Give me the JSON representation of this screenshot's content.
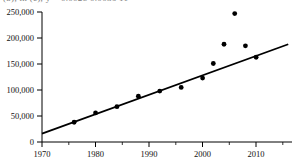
{
  "top_cropped_text": "(b), in (c), y = 0.0028  0.0036  11",
  "chart_data": {
    "type": "scatter",
    "title": "",
    "xlabel": "",
    "ylabel": "",
    "xlim": [
      1970,
      2016
    ],
    "ylim": [
      0,
      250000
    ],
    "grid": false,
    "legend": "none",
    "x_ticks": [
      1970,
      1980,
      1990,
      2000,
      2010
    ],
    "x_tick_labels": [
      "1970",
      "1980",
      "1990",
      "2000",
      "2010"
    ],
    "x_minor_ticks": [
      1975,
      1985,
      1995,
      2005,
      2015
    ],
    "y_ticks": [
      0,
      50000,
      100000,
      150000,
      200000,
      250000
    ],
    "y_tick_labels": [
      "0",
      "50,000",
      "100,000",
      "150,000",
      "200,000",
      "250,000"
    ],
    "marker": "filled-circle",
    "marker_color": "#000000",
    "points": [
      {
        "x": 1976,
        "y": 38000
      },
      {
        "x": 1980,
        "y": 56000
      },
      {
        "x": 1984,
        "y": 68000
      },
      {
        "x": 1988,
        "y": 88000
      },
      {
        "x": 1992,
        "y": 98000
      },
      {
        "x": 1996,
        "y": 105000
      },
      {
        "x": 2000,
        "y": 123000
      },
      {
        "x": 2002,
        "y": 151000
      },
      {
        "x": 2004,
        "y": 188000
      },
      {
        "x": 2006,
        "y": 247000
      },
      {
        "x": 2008,
        "y": 185000
      },
      {
        "x": 2010,
        "y": 163000
      }
    ],
    "series": [
      {
        "name": "observations",
        "type": "scatter",
        "x": [
          1976,
          1980,
          1984,
          1988,
          1992,
          1996,
          2000,
          2002,
          2004,
          2006,
          2008,
          2010
        ],
        "values": [
          38000,
          56000,
          68000,
          88000,
          98000,
          105000,
          123000,
          151000,
          188000,
          247000,
          185000,
          163000
        ]
      },
      {
        "name": "trend-line",
        "type": "line",
        "color": "#000000",
        "x": [
          1970,
          2016
        ],
        "values": [
          16000,
          188000
        ]
      }
    ]
  }
}
